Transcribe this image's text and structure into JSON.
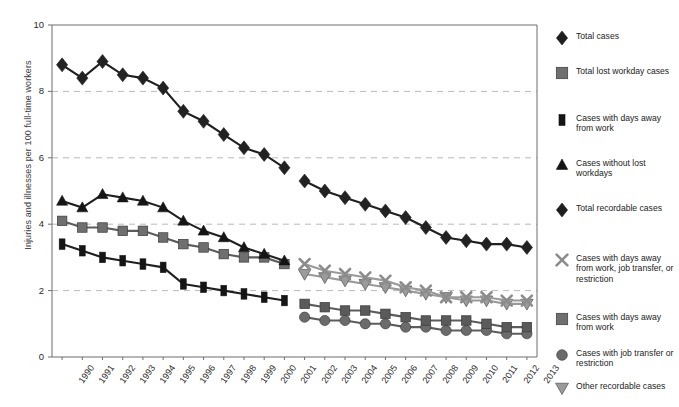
{
  "chart_data": {
    "type": "line",
    "title": "",
    "xlabel": "",
    "ylabel": "Injuries and illnesses per 100 full-time workers",
    "ylim": [
      0,
      10
    ],
    "yticks": [
      0,
      2,
      4,
      6,
      8,
      10
    ],
    "grid": "horizontal dashed gridlines at 2, 4, 6, 8",
    "legend_position": "right",
    "x": [
      "1990",
      "1991",
      "1992",
      "1993",
      "1994",
      "1995",
      "1996",
      "1997",
      "1998",
      "1999",
      "2000",
      "2001",
      "2002",
      "2003",
      "2004",
      "2005",
      "2006",
      "2007",
      "2008",
      "2009",
      "2010",
      "2011",
      "2012",
      "2013"
    ],
    "series": [
      {
        "name": "Total cases",
        "marker": "diamond",
        "color": "#222222",
        "x": [
          "1990",
          "1991",
          "1992",
          "1993",
          "1994",
          "1995",
          "1996",
          "1997",
          "1998",
          "1999",
          "2000",
          "2001"
        ],
        "values": [
          8.8,
          8.4,
          8.9,
          8.5,
          8.4,
          8.1,
          7.4,
          7.1,
          6.7,
          6.3,
          6.1,
          5.7
        ]
      },
      {
        "name": "Total lost workday cases",
        "marker": "square",
        "color": "#6f6f6f",
        "x": [
          "1990",
          "1991",
          "1992",
          "1993",
          "1994",
          "1995",
          "1996",
          "1997",
          "1998",
          "1999",
          "2000",
          "2001"
        ],
        "values": [
          4.1,
          3.9,
          3.9,
          3.8,
          3.8,
          3.6,
          3.4,
          3.3,
          3.1,
          3.0,
          3.0,
          2.8
        ]
      },
      {
        "name": "Cases with days away from work",
        "marker": "square-narrow",
        "color": "#151515",
        "x": [
          "1990",
          "1991",
          "1992",
          "1993",
          "1994",
          "1995",
          "1996",
          "1997",
          "1998",
          "1999",
          "2000",
          "2001"
        ],
        "values": [
          3.4,
          3.2,
          3.0,
          2.9,
          2.8,
          2.7,
          2.2,
          2.1,
          2.0,
          1.9,
          1.8,
          1.7
        ]
      },
      {
        "name": "Cases without lost workdays",
        "marker": "triangle-up",
        "color": "#151515",
        "x": [
          "1990",
          "1991",
          "1992",
          "1993",
          "1994",
          "1995",
          "1996",
          "1997",
          "1998",
          "1999",
          "2000",
          "2001"
        ],
        "values": [
          4.7,
          4.5,
          4.9,
          4.8,
          4.7,
          4.5,
          4.1,
          3.8,
          3.6,
          3.3,
          3.1,
          2.9
        ]
      },
      {
        "name": "Total recordable cases",
        "marker": "diamond",
        "color": "#222222",
        "x": [
          "2002",
          "2003",
          "2004",
          "2005",
          "2006",
          "2007",
          "2008",
          "2009",
          "2010",
          "2011",
          "2012",
          "2013"
        ],
        "values": [
          5.3,
          5.0,
          4.8,
          4.6,
          4.4,
          4.2,
          3.9,
          3.6,
          3.5,
          3.4,
          3.4,
          3.3
        ]
      },
      {
        "name": "Cases with days away from work, job transfer, or restriction",
        "marker": "x",
        "color": "#8c8c8c",
        "x": [
          "2002",
          "2003",
          "2004",
          "2005",
          "2006",
          "2007",
          "2008",
          "2009",
          "2010",
          "2011",
          "2012",
          "2013"
        ],
        "values": [
          2.8,
          2.6,
          2.5,
          2.4,
          2.3,
          2.1,
          2.0,
          1.8,
          1.8,
          1.8,
          1.7,
          1.7
        ]
      },
      {
        "name": "Cases with days away from work",
        "marker": "square",
        "color": "#5a5a5a",
        "x": [
          "2002",
          "2003",
          "2004",
          "2005",
          "2006",
          "2007",
          "2008",
          "2009",
          "2010",
          "2011",
          "2012",
          "2013"
        ],
        "values": [
          1.6,
          1.5,
          1.4,
          1.4,
          1.3,
          1.2,
          1.1,
          1.1,
          1.1,
          1.0,
          0.9,
          0.9
        ]
      },
      {
        "name": "Cases with job transfer or restriction",
        "marker": "circle",
        "color": "#6b6b6b",
        "x": [
          "2002",
          "2003",
          "2004",
          "2005",
          "2006",
          "2007",
          "2008",
          "2009",
          "2010",
          "2011",
          "2012",
          "2013"
        ],
        "values": [
          1.2,
          1.1,
          1.1,
          1.0,
          1.0,
          0.9,
          0.9,
          0.8,
          0.8,
          0.8,
          0.7,
          0.7
        ]
      },
      {
        "name": "Other recordable cases",
        "marker": "triangle-down",
        "color": "#9b9b9b",
        "x": [
          "2002",
          "2003",
          "2004",
          "2005",
          "2006",
          "2007",
          "2008",
          "2009",
          "2010",
          "2011",
          "2012",
          "2013"
        ],
        "values": [
          2.5,
          2.4,
          2.3,
          2.2,
          2.1,
          2.0,
          1.9,
          1.8,
          1.7,
          1.7,
          1.6,
          1.6
        ]
      }
    ]
  },
  "axis": {
    "y_title": "Injuries and illnesses per 100 full-time workers",
    "y_ticks": [
      "10",
      "8",
      "6",
      "4",
      "2",
      "0"
    ],
    "x_ticks": [
      "1990",
      "1991",
      "1992",
      "1993",
      "1994",
      "1995",
      "1996",
      "1997",
      "1998",
      "1999",
      "2000",
      "2001",
      "2002",
      "2003",
      "2004",
      "2005",
      "2006",
      "2007",
      "2008",
      "2009",
      "2010",
      "2011",
      "2012",
      "2013"
    ]
  },
  "legend": {
    "items": [
      {
        "marker": "diamond",
        "label": "Total cases"
      },
      {
        "marker": "square",
        "label": "Total lost workday cases"
      },
      {
        "marker": "square-narrow",
        "label": "Cases with days away from work"
      },
      {
        "marker": "triangle-up",
        "label": "Cases without lost workdays"
      },
      {
        "marker": "diamond",
        "label": "Total recordable cases"
      },
      {
        "marker": "x",
        "label": "Cases with days away from work, job transfer, or restriction"
      },
      {
        "marker": "square",
        "label": "Cases with days away from work"
      },
      {
        "marker": "circle",
        "label": "Cases with job transfer or restriction"
      },
      {
        "marker": "triangle-down",
        "label": "Other recordable cases"
      }
    ]
  },
  "colors": {
    "dark": "#1a1a1a",
    "mid_gray": "#6f6f6f",
    "light_gray": "#9b9b9b",
    "gridline": "#b9b9c2",
    "axis": "#6d6d75"
  }
}
